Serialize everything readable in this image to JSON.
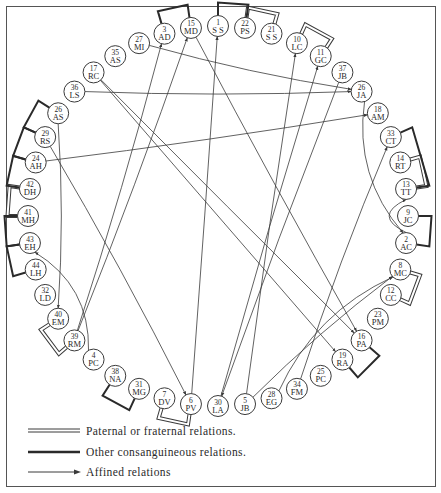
{
  "nodes": [
    {
      "id": "1",
      "initials": "S S",
      "pos": 0
    },
    {
      "id": "22",
      "initials": "PS",
      "pos": 1
    },
    {
      "id": "21",
      "initials": "S S",
      "pos": 2
    },
    {
      "id": "10",
      "initials": "LC",
      "pos": 3
    },
    {
      "id": "11",
      "initials": "GC",
      "pos": 4
    },
    {
      "id": "37",
      "initials": "JB",
      "pos": 5
    },
    {
      "id": "26",
      "initials": "JA",
      "pos": 6
    },
    {
      "id": "18",
      "initials": "AM",
      "pos": 7
    },
    {
      "id": "33",
      "initials": "CT",
      "pos": 8
    },
    {
      "id": "14",
      "initials": "RT",
      "pos": 9
    },
    {
      "id": "13",
      "initials": "TT",
      "pos": 10
    },
    {
      "id": "9",
      "initials": "JC",
      "pos": 11
    },
    {
      "id": "2",
      "initials": "AC",
      "pos": 12
    },
    {
      "id": "8",
      "initials": "MC",
      "pos": 13
    },
    {
      "id": "12",
      "initials": "CC",
      "pos": 14
    },
    {
      "id": "23",
      "initials": "PM",
      "pos": 15
    },
    {
      "id": "16",
      "initials": "PA",
      "pos": 16
    },
    {
      "id": "19",
      "initials": "RA",
      "pos": 17
    },
    {
      "id": "25",
      "initials": "PC",
      "pos": 18
    },
    {
      "id": "34",
      "initials": "FM",
      "pos": 19
    },
    {
      "id": "28",
      "initials": "EG",
      "pos": 20
    },
    {
      "id": "5",
      "initials": "JB",
      "pos": 21
    },
    {
      "id": "30",
      "initials": "LA",
      "pos": 22
    },
    {
      "id": "6",
      "initials": "PV",
      "pos": 23
    },
    {
      "id": "7",
      "initials": "DV",
      "pos": 24
    },
    {
      "id": "31",
      "initials": "MG",
      "pos": 25
    },
    {
      "id": "38",
      "initials": "NA",
      "pos": 26
    },
    {
      "id": "4",
      "initials": "PC",
      "pos": 27
    },
    {
      "id": "39",
      "initials": "RM",
      "pos": 28
    },
    {
      "id": "40",
      "initials": "EM",
      "pos": 29
    },
    {
      "id": "32",
      "initials": "LD",
      "pos": 30
    },
    {
      "id": "44",
      "initials": "LH",
      "pos": 31
    },
    {
      "id": "43",
      "initials": "EH",
      "pos": 32
    },
    {
      "id": "41",
      "initials": "MH",
      "pos": 33
    },
    {
      "id": "42",
      "initials": "DH",
      "pos": 34
    },
    {
      "id": "24",
      "initials": "AH",
      "pos": 35
    },
    {
      "id": "29",
      "initials": "RS",
      "pos": 36
    },
    {
      "id": "26b",
      "initials": "AS",
      "pos": 37,
      "label": "26"
    },
    {
      "id": "36",
      "initials": "LS",
      "pos": 38
    },
    {
      "id": "17",
      "initials": "RC",
      "pos": 39
    },
    {
      "id": "35",
      "initials": "AS",
      "pos": 40
    },
    {
      "id": "27",
      "initials": "MI",
      "pos": 41
    },
    {
      "id": "3",
      "initials": "AD",
      "pos": 42
    },
    {
      "id": "15",
      "initials": "MD",
      "pos": 43
    }
  ],
  "paternal_relations": [
    [
      "22",
      "21"
    ],
    [
      "10",
      "11"
    ],
    [
      "14",
      "13"
    ],
    [
      "8",
      "12"
    ],
    [
      "42",
      "41"
    ],
    [
      "40",
      "39"
    ],
    [
      "7",
      "6"
    ]
  ],
  "consanguineous_relations": [
    [
      "1",
      "22"
    ],
    [
      "3",
      "15"
    ],
    [
      "33",
      "13"
    ],
    [
      "9",
      "2"
    ],
    [
      "16",
      "19"
    ],
    [
      "38",
      "31"
    ],
    [
      "26b",
      "29"
    ],
    [
      "29",
      "24"
    ],
    [
      "24",
      "42"
    ],
    [
      "41",
      "43"
    ],
    [
      "43",
      "44"
    ]
  ],
  "affined_relations": [
    [
      "6",
      "1"
    ],
    [
      "39",
      "3"
    ],
    [
      "39",
      "15"
    ],
    [
      "30",
      "11"
    ],
    [
      "5",
      "10"
    ],
    [
      "27",
      "26"
    ],
    [
      "24",
      "18"
    ],
    [
      "34",
      "33"
    ],
    [
      "5",
      "8"
    ],
    [
      "28",
      "8"
    ],
    [
      "2",
      "13"
    ],
    [
      "26",
      "2"
    ],
    [
      "17",
      "19"
    ],
    [
      "17",
      "16"
    ],
    [
      "26b",
      "40"
    ],
    [
      "36",
      "26"
    ],
    [
      "29",
      "6"
    ],
    [
      "4",
      "43"
    ],
    [
      "15",
      "16"
    ],
    [
      "37",
      "30"
    ]
  ],
  "legend": [
    {
      "type": "paternal",
      "label": "Paternal or fraternal relations."
    },
    {
      "type": "consanguineous",
      "label": "Other consanguineous relations."
    },
    {
      "type": "affined",
      "label": "Affined relations"
    }
  ],
  "colors": {
    "line": "#3a3a3a",
    "node_fill": "#ffffff",
    "frame": "#555555"
  }
}
